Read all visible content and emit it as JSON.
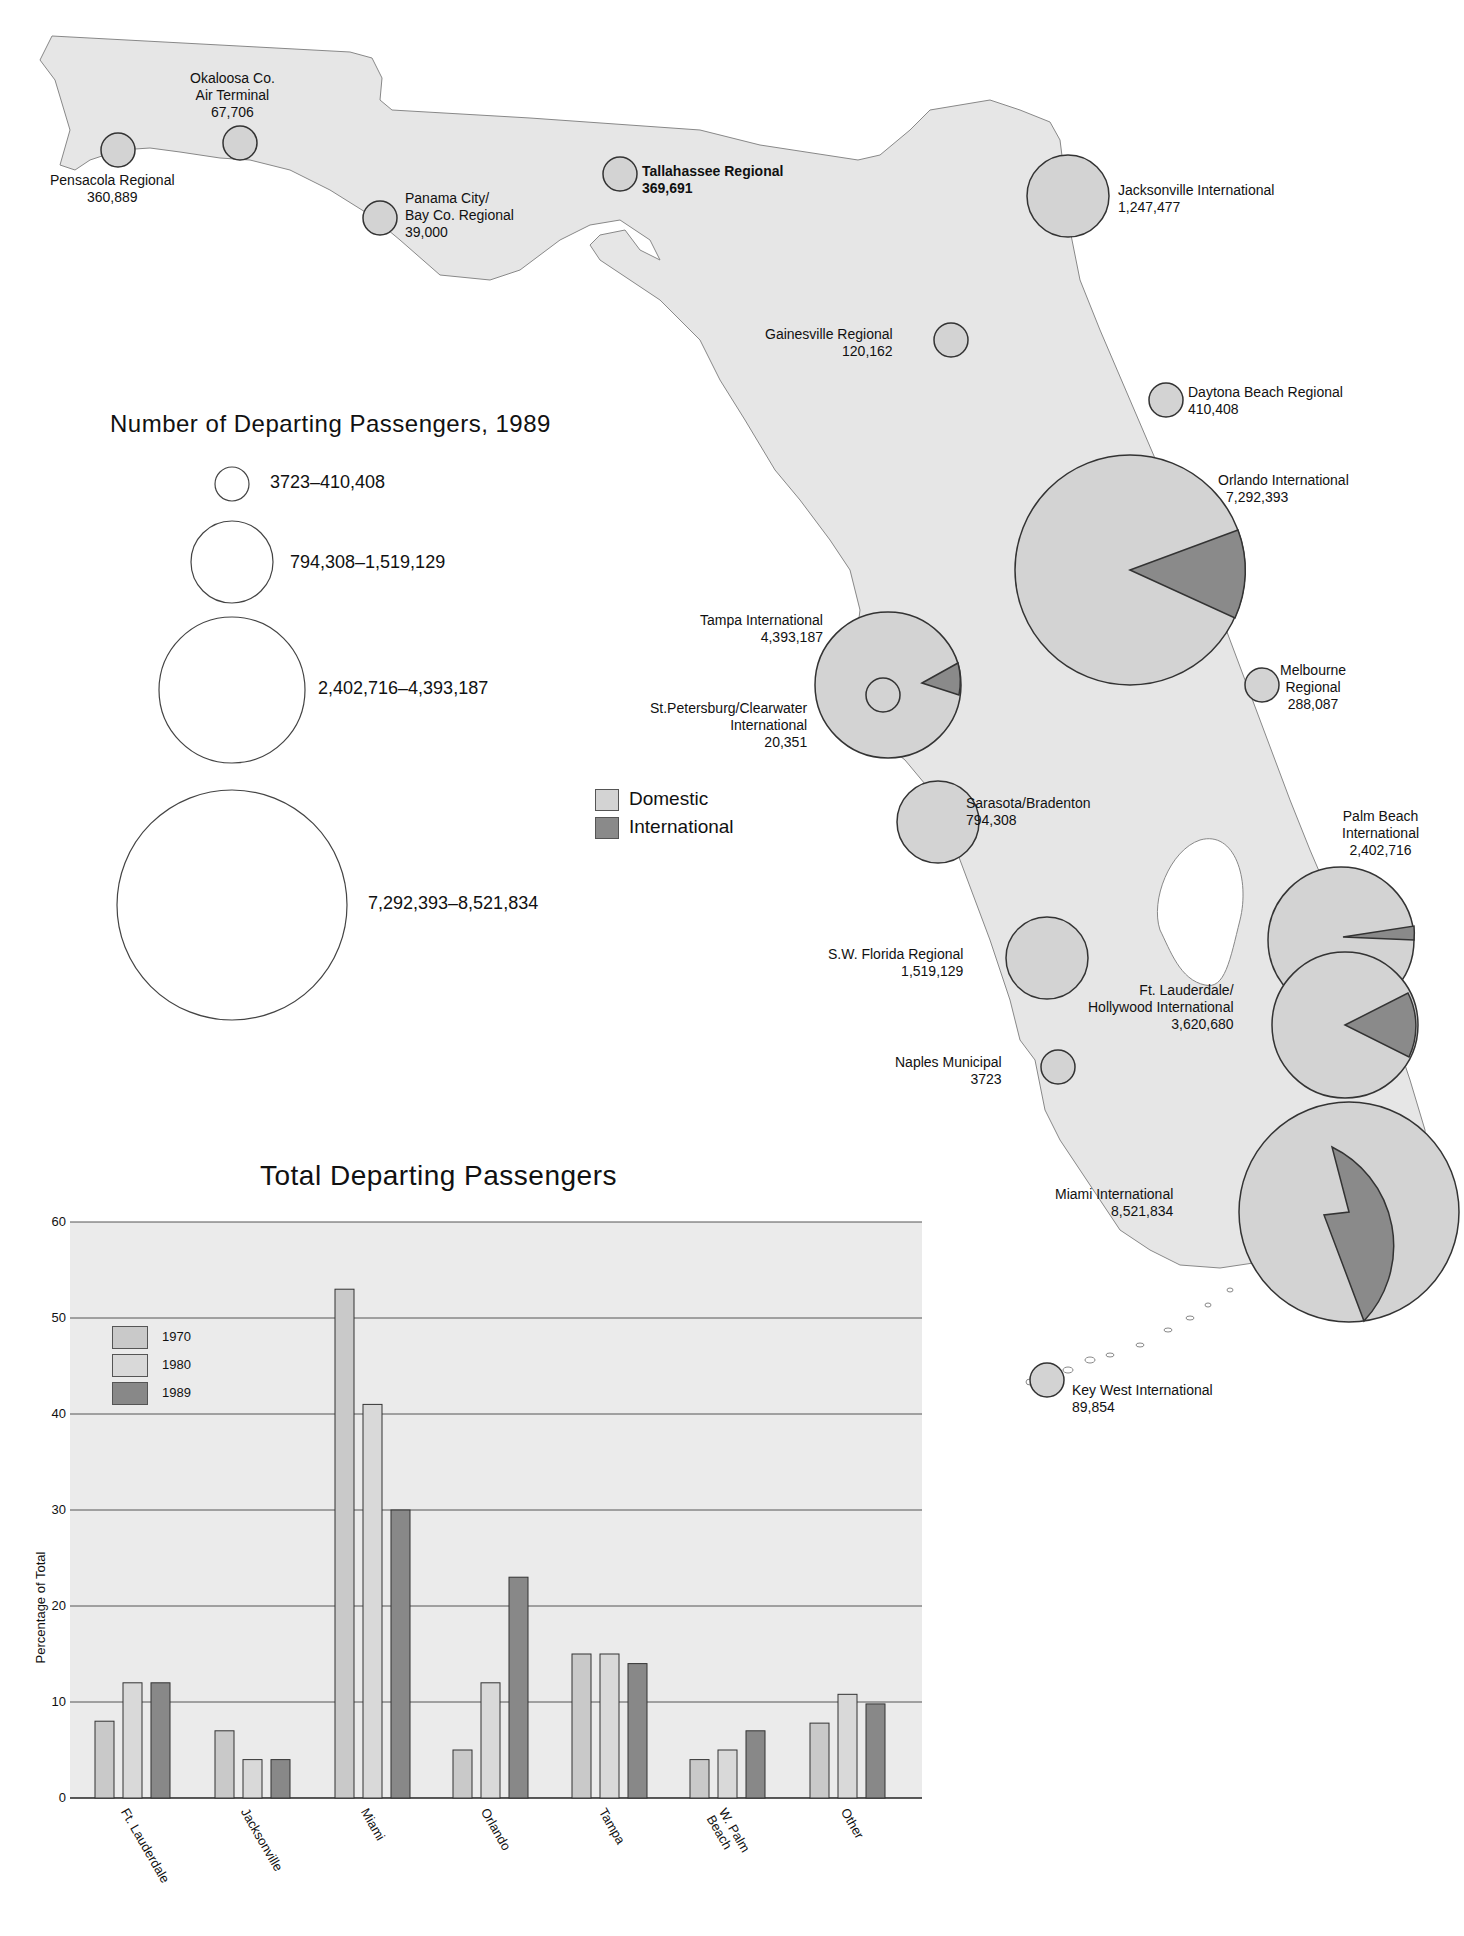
{
  "map": {
    "partial_title_visible": "…g",
    "colors": {
      "land": "#e6e6e6",
      "domestic": "#d3d3d3",
      "international": "#8a8a8a",
      "outline": "#333333"
    },
    "airports": [
      {
        "name": "Pensacola Regional",
        "passengers": "360,889"
      },
      {
        "name": "Okaloosa Co. Air Terminal",
        "line1": "Okaloosa Co.",
        "line2": "Air Terminal",
        "passengers": "67,706"
      },
      {
        "name": "Panama City/Bay Co. Regional",
        "line1": "Panama City/",
        "line2": "Bay Co. Regional",
        "passengers": "39,000"
      },
      {
        "name": "Tallahassee Regional",
        "passengers": "369,691"
      },
      {
        "name": "Jacksonville International",
        "passengers": "1,247,477"
      },
      {
        "name": "Gainesville Regional",
        "passengers": "120,162"
      },
      {
        "name": "Daytona Beach Regional",
        "passengers": "410,408"
      },
      {
        "name": "Orlando International",
        "passengers": "7,292,393"
      },
      {
        "name": "Tampa International",
        "passengers": "4,393,187"
      },
      {
        "name": "St.Petersburg/Clearwater International",
        "line1": "St.Petersburg/Clearwater",
        "line2": "International",
        "passengers": "20,351"
      },
      {
        "name": "Melbourne Regional",
        "line1": "Melbourne",
        "line2": "Regional",
        "passengers": "288,087"
      },
      {
        "name": "Sarasota/Bradenton",
        "passengers": "794,308"
      },
      {
        "name": "Palm Beach International",
        "line1": "Palm Beach",
        "line2": "International",
        "passengers": "2,402,716"
      },
      {
        "name": "S.W. Florida Regional",
        "passengers": "1,519,129"
      },
      {
        "name": "Ft. Lauderdale/Hollywood International",
        "line1": "Ft. Lauderdale/",
        "line2": "Hollywood International",
        "passengers": "3,620,680"
      },
      {
        "name": "Naples Municipal",
        "passengers": "3723"
      },
      {
        "name": "Miami International",
        "passengers": "8,521,834"
      },
      {
        "name": "Key West International",
        "passengers": "89,854"
      }
    ],
    "size_legend": {
      "title": "Number of Departing Passengers, 1989",
      "classes": [
        "3723–410,408",
        "794,308–1,519,129",
        "2,402,716–4,393,187",
        "7,292,393–8,521,834"
      ]
    },
    "type_legend": {
      "items": [
        {
          "label": "Domestic",
          "color": "#d3d3d3"
        },
        {
          "label": "International",
          "color": "#8a8a8a"
        }
      ]
    }
  },
  "chart_data": {
    "type": "bar",
    "title": "Total Departing Passengers",
    "xlabel": "",
    "ylabel": "Percentage of Total",
    "ylim": [
      0,
      60
    ],
    "yticks": [
      0,
      10,
      20,
      30,
      40,
      50,
      60
    ],
    "grid": true,
    "legend_position": "upper-left inside",
    "categories": [
      "Ft. Lauderdale",
      "Jacksonville",
      "Miami",
      "Orlando",
      "Tampa",
      "W. Palm Beach",
      "Other"
    ],
    "series": [
      {
        "name": "1970",
        "color": "#c9c9c9",
        "values": [
          8,
          7,
          53,
          5,
          15,
          4,
          7.8
        ]
      },
      {
        "name": "1980",
        "color": "#d9d9d9",
        "values": [
          12,
          4,
          41,
          12,
          15,
          5,
          10.8
        ]
      },
      {
        "name": "1989",
        "color": "#888888",
        "values": [
          12,
          4,
          30,
          23,
          14,
          7,
          9.8
        ]
      }
    ]
  }
}
